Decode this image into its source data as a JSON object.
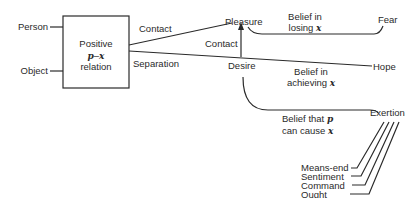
{
  "diagram": {
    "inputs": {
      "person": "Person",
      "object": "Object"
    },
    "box": {
      "line1": "Positive",
      "line2_var1": "p",
      "line2_dash": "–",
      "line2_var2": "x",
      "line3": "relation"
    },
    "edges": {
      "contact_top": "Contact",
      "separation": "Separation",
      "contact_vertical": "Contact",
      "belief_losing_line1": "Belief in",
      "belief_losing_line2": "losing",
      "belief_losing_var": "x",
      "belief_achieving_line1": "Belief in",
      "belief_achieving_line2": "achieving",
      "belief_achieving_var": "x",
      "belief_cause_line1": "Belief that",
      "belief_cause_var1": "p",
      "belief_cause_line2": "can cause",
      "belief_cause_var2": "x"
    },
    "nodes": {
      "pleasure": "Pleasure",
      "desire": "Desire",
      "fear": "Fear",
      "hope": "Hope",
      "exertion": "Exertion"
    },
    "exertion_sources": [
      "Means-end",
      "Sentiment",
      "Command",
      "Ought"
    ],
    "colors": {
      "line": "#2a2a2a",
      "text": "#2a2a2a",
      "background": "#ffffff"
    }
  }
}
